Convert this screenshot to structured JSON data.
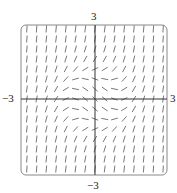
{
  "figure": {
    "type": "slope_field",
    "equation_hint": "dy/dx = x^2 + y^2 - 1",
    "x_range": [
      -3,
      3
    ],
    "y_range": [
      -3,
      3
    ],
    "grid_count": 15,
    "segment_length_px": 7,
    "colors": {
      "segments": "#555555",
      "axes": "#333333",
      "frame": "#888888"
    },
    "labels": {
      "top": "3",
      "bottom": "−3",
      "left": "−3",
      "right": "3"
    },
    "frame_px": {
      "left": 21,
      "top": 25,
      "right": 167,
      "bottom": 175,
      "radius": 5
    },
    "origin_px": {
      "x": 95,
      "y": 99
    }
  }
}
